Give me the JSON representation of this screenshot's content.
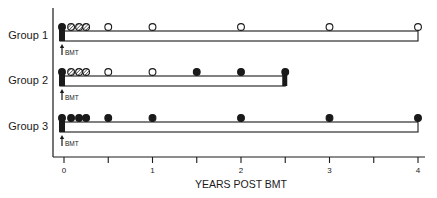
{
  "chart_data": {
    "type": "timeline",
    "title": "",
    "xlabel": "YEARS POST BMT",
    "ylabel": "",
    "xlim": [
      0,
      4
    ],
    "x_ticks": [
      0,
      0.5,
      1,
      1.5,
      2,
      2.5,
      3,
      3.5,
      4
    ],
    "x_tick_labels": [
      "0",
      "",
      "1",
      "",
      "2",
      "",
      "3",
      "",
      "4"
    ],
    "groups": [
      {
        "name": "Group 1",
        "followup_end_years": 4,
        "end_block": false,
        "bmt_label": "BMT",
        "markers": [
          {
            "t": 0,
            "type": "filled"
          },
          {
            "t": 0.08,
            "type": "hatched"
          },
          {
            "t": 0.17,
            "type": "hatched"
          },
          {
            "t": 0.25,
            "type": "hatched"
          },
          {
            "t": 0.5,
            "type": "open"
          },
          {
            "t": 1,
            "type": "open"
          },
          {
            "t": 2,
            "type": "open"
          },
          {
            "t": 3,
            "type": "open"
          },
          {
            "t": 4,
            "type": "open"
          }
        ]
      },
      {
        "name": "Group 2",
        "followup_end_years": 2.5,
        "end_block": true,
        "bmt_label": "BMT",
        "markers": [
          {
            "t": 0,
            "type": "filled"
          },
          {
            "t": 0.08,
            "type": "hatched"
          },
          {
            "t": 0.17,
            "type": "hatched"
          },
          {
            "t": 0.25,
            "type": "hatched"
          },
          {
            "t": 0.5,
            "type": "open"
          },
          {
            "t": 1,
            "type": "open"
          },
          {
            "t": 1.5,
            "type": "filled"
          },
          {
            "t": 2,
            "type": "filled"
          },
          {
            "t": 2.5,
            "type": "filled"
          }
        ]
      },
      {
        "name": "Group 3",
        "followup_end_years": 4,
        "end_block": false,
        "bmt_label": "BMT",
        "markers": [
          {
            "t": 0,
            "type": "filled"
          },
          {
            "t": 0.08,
            "type": "filled"
          },
          {
            "t": 0.17,
            "type": "filled"
          },
          {
            "t": 0.25,
            "type": "filled"
          },
          {
            "t": 0.5,
            "type": "filled"
          },
          {
            "t": 1,
            "type": "filled"
          },
          {
            "t": 2,
            "type": "filled"
          },
          {
            "t": 3,
            "type": "filled"
          },
          {
            "t": 4,
            "type": "filled"
          }
        ]
      }
    ],
    "legend": [],
    "grid": false
  },
  "colors": {
    "ink": "#1a1a1a",
    "background": "#ffffff"
  }
}
